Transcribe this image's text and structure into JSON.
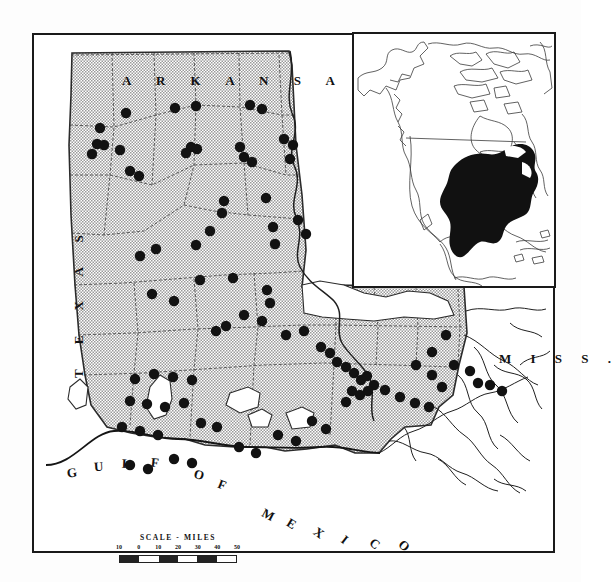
{
  "figure": {
    "type": "distribution-map"
  },
  "labels": {
    "arkansas": "A R K A N S A S",
    "texas": "T E X A S",
    "mississippi": "M I S S .",
    "gulf_of_mexico_chars": [
      "G",
      "U",
      "L",
      "F",
      "O",
      "F",
      "M",
      "E",
      "X",
      "I",
      "C",
      "O"
    ]
  },
  "scale": {
    "title": "SCALE - MILES",
    "ticks": [
      "10",
      "0",
      "10",
      "20",
      "30",
      "40",
      "50"
    ],
    "unit": "miles"
  },
  "inset": {
    "title": "",
    "region": "North America",
    "range_fill_color": "#111111",
    "outline_color": "#333333"
  },
  "colors": {
    "frame": "#1a1a1a",
    "stipple_fill": "#b9b9b9",
    "land_white": "#ffffff",
    "dot": "#121212",
    "boundary": "#2a2a2a"
  },
  "chart_data": {
    "type": "scatter",
    "xlabel": "",
    "ylabel": "",
    "note": "Each point is a collection locality plotted on the Louisiana state map",
    "point_count": 92,
    "points": [
      [
        92,
        78
      ],
      [
        141,
        73
      ],
      [
        162,
        71
      ],
      [
        216,
        70
      ],
      [
        228,
        74
      ],
      [
        66,
        93
      ],
      [
        63,
        109
      ],
      [
        70,
        110
      ],
      [
        58,
        119
      ],
      [
        86,
        115
      ],
      [
        157,
        112
      ],
      [
        152,
        118
      ],
      [
        163,
        114
      ],
      [
        206,
        112
      ],
      [
        210,
        122
      ],
      [
        218,
        127
      ],
      [
        250,
        104
      ],
      [
        259,
        110
      ],
      [
        256,
        124
      ],
      [
        96,
        136
      ],
      [
        105,
        141
      ],
      [
        190,
        166
      ],
      [
        188,
        178
      ],
      [
        232,
        163
      ],
      [
        176,
        196
      ],
      [
        162,
        210
      ],
      [
        122,
        214
      ],
      [
        239,
        192
      ],
      [
        241,
        209
      ],
      [
        264,
        185
      ],
      [
        272,
        199
      ],
      [
        106,
        221
      ],
      [
        166,
        245
      ],
      [
        199,
        243
      ],
      [
        233,
        255
      ],
      [
        236,
        268
      ],
      [
        118,
        259
      ],
      [
        140,
        266
      ],
      [
        182,
        296
      ],
      [
        192,
        291
      ],
      [
        210,
        280
      ],
      [
        228,
        286
      ],
      [
        252,
        300
      ],
      [
        270,
        296
      ],
      [
        287,
        312
      ],
      [
        296,
        318
      ],
      [
        303,
        327
      ],
      [
        312,
        332
      ],
      [
        320,
        338
      ],
      [
        327,
        345
      ],
      [
        333,
        341
      ],
      [
        340,
        350
      ],
      [
        318,
        356
      ],
      [
        326,
        360
      ],
      [
        334,
        356
      ],
      [
        312,
        367
      ],
      [
        351,
        355
      ],
      [
        366,
        362
      ],
      [
        382,
        330
      ],
      [
        398,
        317
      ],
      [
        412,
        300
      ],
      [
        420,
        330
      ],
      [
        436,
        336
      ],
      [
        444,
        348
      ],
      [
        398,
        340
      ],
      [
        408,
        352
      ],
      [
        456,
        350
      ],
      [
        468,
        356
      ],
      [
        381,
        368
      ],
      [
        395,
        372
      ],
      [
        101,
        344
      ],
      [
        120,
        339
      ],
      [
        139,
        342
      ],
      [
        158,
        345
      ],
      [
        96,
        366
      ],
      [
        113,
        369
      ],
      [
        131,
        372
      ],
      [
        150,
        368
      ],
      [
        88,
        392
      ],
      [
        106,
        396
      ],
      [
        124,
        400
      ],
      [
        167,
        388
      ],
      [
        183,
        392
      ],
      [
        140,
        424
      ],
      [
        158,
        428
      ],
      [
        96,
        430
      ],
      [
        114,
        434
      ],
      [
        205,
        412
      ],
      [
        222,
        418
      ],
      [
        244,
        400
      ],
      [
        262,
        406
      ],
      [
        278,
        386
      ],
      [
        292,
        394
      ]
    ]
  }
}
